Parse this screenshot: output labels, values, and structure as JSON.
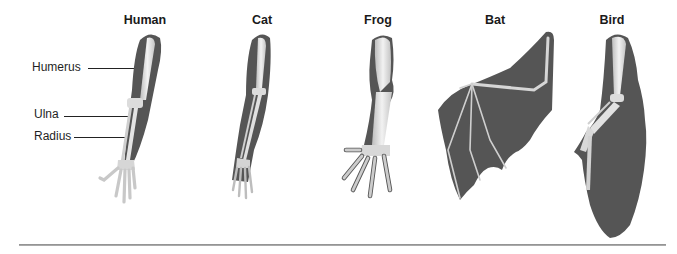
{
  "diagram": {
    "type": "homologous-forelimb-structures",
    "organisms": [
      {
        "name": "Human",
        "center_x": 145
      },
      {
        "name": "Cat",
        "center_x": 262
      },
      {
        "name": "Frog",
        "center_x": 378
      },
      {
        "name": "Bat",
        "center_x": 495
      },
      {
        "name": "Bird",
        "center_x": 612
      }
    ],
    "bone_labels": [
      {
        "text": "Humerus",
        "x": 32,
        "y": 62
      },
      {
        "text": "Ulna",
        "x": 34,
        "y": 109
      },
      {
        "text": "Radius",
        "x": 34,
        "y": 130
      }
    ],
    "colors": {
      "skin": "#555555",
      "bone": "#e6e6e6",
      "bone_shade": "#bdbdbd",
      "text": "#1a1a1a",
      "baseline": "#9a9a9a"
    }
  }
}
